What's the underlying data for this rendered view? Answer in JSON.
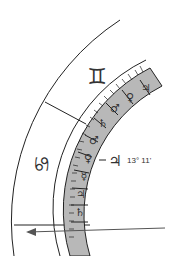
{
  "chart": {
    "signs": [
      {
        "name": "Gemini",
        "glyph": "♊"
      },
      {
        "name": "Cancer",
        "glyph": "♋"
      }
    ],
    "band_glyphs": [
      "♃",
      "♀",
      "♂",
      "♄",
      "♂",
      "♀",
      "☿",
      "♃",
      "♄",
      ""
    ],
    "planet_marker": {
      "glyph": "♃",
      "degree": "13° 11'"
    },
    "colors": {
      "band_fill": "#b8b8b8",
      "line": "#222222",
      "arrow": "#555555"
    }
  }
}
